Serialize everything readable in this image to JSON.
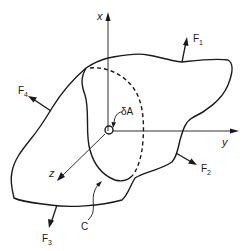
{
  "diagram": {
    "type": "free-body diagram of a deformable body cut by a surface",
    "axes": {
      "x_label": "x",
      "y_label": "y",
      "z_label": "z"
    },
    "area_element_label": "δA",
    "cut_curve_label": "C",
    "forces": [
      {
        "name": "F",
        "subscript": "1"
      },
      {
        "name": "F",
        "subscript": "2"
      },
      {
        "name": "F",
        "subscript": "3"
      },
      {
        "name": "F",
        "subscript": "4"
      }
    ],
    "colors": {
      "stroke": "#1a1a1a",
      "background": "#ffffff"
    }
  }
}
